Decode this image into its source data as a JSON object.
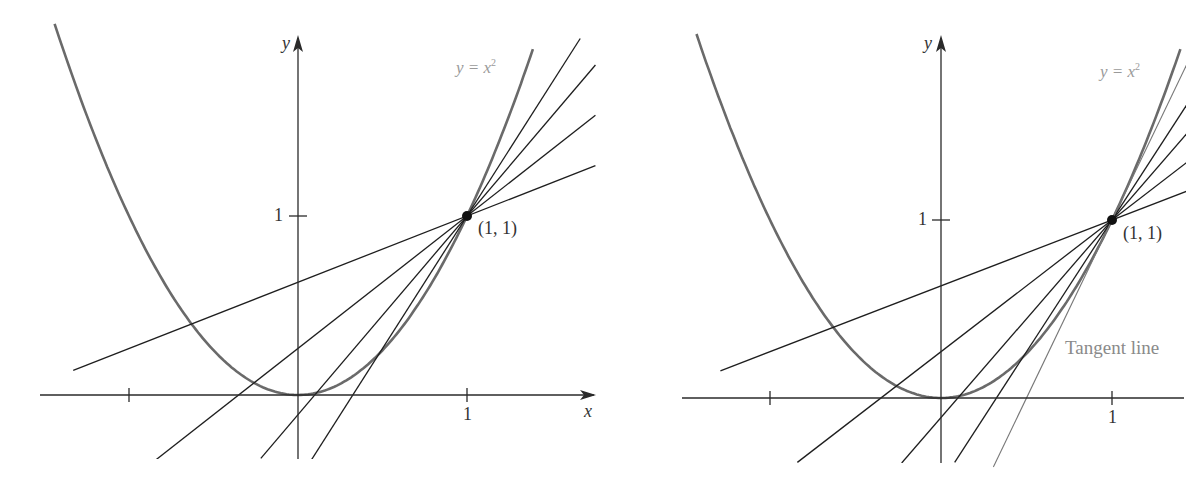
{
  "figure": {
    "background": "#ffffff",
    "colors": {
      "axis": "#2a2a2a",
      "parabola": "#6a6a6a",
      "secant": "#1e1e1e",
      "tangent": "#777777",
      "curve_label": "#9a9a9a"
    }
  },
  "panels": [
    {
      "id": "left",
      "origin_px": [
        298,
        395
      ],
      "unit_px": [
        169,
        179
      ],
      "x_axis": {
        "from_px": 40,
        "to_px": 596,
        "label": "x",
        "label_px": [
          584,
          402
        ]
      },
      "y_axis": {
        "from_px": 459,
        "to_px": 35,
        "label": "y",
        "label_px": [
          282,
          34
        ]
      },
      "x_ticks": [
        {
          "value": -1,
          "label": ""
        },
        {
          "value": 1,
          "label": "1"
        }
      ],
      "y_ticks": [
        {
          "value": 1,
          "label": "1"
        }
      ],
      "parabola": {
        "equation": "y = x",
        "exponent": "2",
        "x_range": [
          -1.44,
          1.39
        ],
        "label_px": [
          456,
          58
        ]
      },
      "point": {
        "x": 1,
        "y": 1,
        "label": "(1, 1)",
        "label_px": [
          478,
          219
        ]
      },
      "secants": [
        {
          "slope": 1.48,
          "x_end_math": [
            0.08,
            1.67
          ]
        },
        {
          "slope": 1.11,
          "x_end_math": [
            -0.22,
            1.76
          ]
        },
        {
          "slope": 0.74,
          "x_end_math": [
            -0.84,
            1.76
          ]
        },
        {
          "slope": 0.37,
          "x_end_math": [
            -1.33,
            1.76
          ]
        }
      ],
      "tangent": null,
      "bottom_px": 459
    },
    {
      "id": "right",
      "origin_px": [
        941,
        398
      ],
      "unit_px": [
        171,
        178
      ],
      "x_axis": {
        "from_px": 682,
        "to_px": 1186,
        "label": "",
        "label_px": [
          0,
          0
        ]
      },
      "y_axis": {
        "from_px": 463,
        "to_px": 35,
        "label": "y",
        "label_px": [
          924,
          34
        ]
      },
      "x_ticks": [
        {
          "value": -1,
          "label": ""
        },
        {
          "value": 1,
          "label": "1"
        }
      ],
      "y_ticks": [
        {
          "value": 1,
          "label": "1"
        }
      ],
      "parabola": {
        "equation": "y = x",
        "exponent": "2",
        "x_range": [
          -1.43,
          1.4
        ],
        "label_px": [
          1100,
          58
        ]
      },
      "point": {
        "x": 1,
        "y": 1,
        "label": "(1, 1)",
        "label_px": [
          1123,
          224
        ]
      },
      "secants": [
        {
          "slope": 1.48,
          "x_end_math": [
            0.08,
            1.44
          ]
        },
        {
          "slope": 1.11,
          "x_end_math": [
            -0.23,
            1.44
          ]
        },
        {
          "slope": 0.74,
          "x_end_math": [
            -0.84,
            1.44
          ]
        },
        {
          "slope": 0.37,
          "x_end_math": [
            -1.29,
            1.44
          ]
        }
      ],
      "tangent": {
        "slope": 2,
        "label": "Tangent line",
        "label_px": [
          1065,
          338
        ],
        "x_end_math": [
          0.3,
          1.44
        ]
      },
      "bottom_px": 463
    }
  ],
  "chart_data": {
    "type": "line",
    "xlabel": "x",
    "ylabel": "y",
    "xlim": [
      -1.5,
      1.75
    ],
    "ylim": [
      -0.4,
      2.0
    ],
    "tick_labels": {
      "x": [
        "1"
      ],
      "y": [
        "1"
      ]
    },
    "annotations": [
      "y = x²",
      "(1, 1)",
      "Tangent line"
    ],
    "series": [
      {
        "name": "y = x²",
        "kind": "curve",
        "function": "x^2"
      },
      {
        "name": "secant slope 0.37",
        "kind": "line",
        "through": [
          1,
          1
        ],
        "slope": 0.37
      },
      {
        "name": "secant slope 0.74",
        "kind": "line",
        "through": [
          1,
          1
        ],
        "slope": 0.74
      },
      {
        "name": "secant slope 1.11",
        "kind": "line",
        "through": [
          1,
          1
        ],
        "slope": 1.11
      },
      {
        "name": "secant slope 1.48",
        "kind": "line",
        "through": [
          1,
          1
        ],
        "slope": 1.48
      },
      {
        "name": "Tangent line (right panel)",
        "kind": "line",
        "through": [
          1,
          1
        ],
        "slope": 2
      }
    ],
    "grid": false,
    "legend": "none"
  }
}
